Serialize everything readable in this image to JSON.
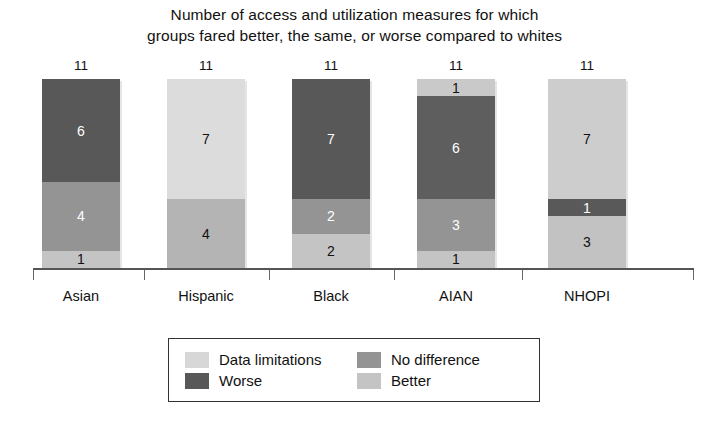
{
  "chart_data": {
    "type": "bar",
    "subtype": "stacked-vertical",
    "title": "Number of access and utilization measures for which groups fared better, the same, or worse compared to whites",
    "title_lines": [
      "Number of access and utilization measures for which",
      "groups fared better, the same, or worse compared to whites"
    ],
    "xlabel": "",
    "ylabel": "",
    "ylim": [
      0,
      11
    ],
    "grid": false,
    "legend_position": "bottom-center",
    "categories": [
      "Asian",
      "Hispanic",
      "Black",
      "AIAN",
      "NHOPI"
    ],
    "totals": [
      11,
      11,
      11,
      11,
      11
    ],
    "total_labels": [
      "11",
      "11",
      "11",
      "11",
      "11"
    ],
    "series": [
      {
        "name": "Data limitations",
        "color": "#d7d7d7",
        "values": [
          0,
          7,
          0,
          1,
          7
        ]
      },
      {
        "name": "Worse",
        "color": "#585858",
        "values": [
          6,
          0,
          7,
          6,
          1
        ]
      },
      {
        "name": "No difference",
        "color": "#949494",
        "values": [
          4,
          4,
          2,
          3,
          0
        ]
      },
      {
        "name": "Better",
        "color": "#c4c4c4",
        "values": [
          1,
          0,
          2,
          1,
          3
        ]
      }
    ],
    "stacks": [
      {
        "category": "Asian",
        "total": "11",
        "segments": [
          {
            "series": "Worse",
            "value": 6,
            "label": "6",
            "color": "#585858",
            "text_color": "#ffffff"
          },
          {
            "series": "No difference",
            "value": 4,
            "label": "4",
            "color": "#949494",
            "text_color": "#ffffff"
          },
          {
            "series": "Better",
            "value": 1,
            "label": "1",
            "color": "#c4c4c4",
            "text_color": "#111111"
          }
        ]
      },
      {
        "category": "Hispanic",
        "total": "11",
        "segments": [
          {
            "series": "Data limitations",
            "value": 7,
            "label": "7",
            "color": "#dcdcdc",
            "text_color": "#111111"
          },
          {
            "series": "No difference",
            "value": 4,
            "label": "4",
            "color": "#b4b4b4",
            "text_color": "#111111"
          }
        ]
      },
      {
        "category": "Black",
        "total": "11",
        "segments": [
          {
            "series": "Worse",
            "value": 7,
            "label": "7",
            "color": "#585858",
            "text_color": "#ffffff"
          },
          {
            "series": "No difference",
            "value": 2,
            "label": "2",
            "color": "#949494",
            "text_color": "#ffffff"
          },
          {
            "series": "Better",
            "value": 2,
            "label": "2",
            "color": "#c4c4c4",
            "text_color": "#111111"
          }
        ]
      },
      {
        "category": "AIAN",
        "total": "11",
        "segments": [
          {
            "series": "Data limitations",
            "value": 1,
            "label": "1",
            "color": "#c9c9c9",
            "text_color": "#111111"
          },
          {
            "series": "Worse",
            "value": 6,
            "label": "6",
            "color": "#5e5e5e",
            "text_color": "#ffffff"
          },
          {
            "series": "No difference",
            "value": 3,
            "label": "3",
            "color": "#949494",
            "text_color": "#ffffff"
          },
          {
            "series": "Better",
            "value": 1,
            "label": "1",
            "color": "#c4c4c4",
            "text_color": "#111111"
          }
        ]
      },
      {
        "category": "NHOPI",
        "total": "11",
        "segments": [
          {
            "series": "Data limitations",
            "value": 7,
            "label": "7",
            "color": "#cdcdcd",
            "text_color": "#111111"
          },
          {
            "series": "Worse",
            "value": 1,
            "label": "1",
            "color": "#595959",
            "text_color": "#ffffff"
          },
          {
            "series": "Better",
            "value": 3,
            "label": "3",
            "color": "#c2c2c2",
            "text_color": "#111111"
          }
        ]
      }
    ],
    "legend": [
      {
        "label": "Data limitations",
        "color": "#d7d7d7"
      },
      {
        "label": "No difference",
        "color": "#949494"
      },
      {
        "label": "Worse",
        "color": "#585858"
      },
      {
        "label": "Better",
        "color": "#c4c4c4"
      }
    ]
  },
  "axis": {
    "baseline_color": "#555555"
  }
}
